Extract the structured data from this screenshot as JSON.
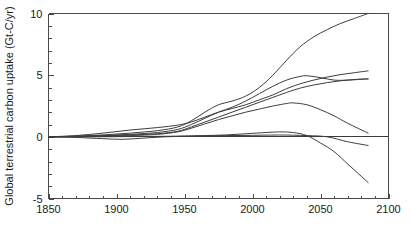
{
  "chart_data": {
    "type": "line",
    "title": "",
    "xlabel": "",
    "ylabel": "Global terrestrial carbon uptake (Gt-C/yr)",
    "xlim": [
      1850,
      2100
    ],
    "ylim": [
      -5,
      10
    ],
    "xticks": [
      1850,
      1900,
      1950,
      2000,
      2050,
      2100
    ],
    "xtick_labels": [
      "1850",
      "1900",
      "1950",
      "2000",
      "2050",
      "2100"
    ],
    "yticks": [
      -5,
      0,
      5,
      10
    ],
    "ytick_labels": [
      "-5",
      "0",
      "5",
      "10"
    ],
    "x_minor_tick_interval": 10,
    "y_minor_tick_interval": 1,
    "grid": false,
    "legend": null,
    "zero_reference_line": true,
    "series": [
      {
        "name": "curve-1-highest",
        "x": [
          1850,
          1870,
          1890,
          1910,
          1930,
          1945,
          1955,
          1965,
          1975,
          1985,
          1995,
          2005,
          2015,
          2025,
          2035,
          2045,
          2055,
          2065,
          2075,
          2085
        ],
        "values": [
          0.0,
          0.05,
          0.15,
          0.3,
          0.5,
          0.8,
          1.3,
          2.0,
          2.6,
          2.9,
          3.3,
          4.0,
          5.0,
          6.2,
          7.3,
          8.1,
          8.7,
          9.2,
          9.6,
          10.0
        ]
      },
      {
        "name": "curve-2-upper-rising",
        "x": [
          1850,
          1870,
          1890,
          1910,
          1930,
          1945,
          1955,
          1965,
          1975,
          1985,
          1995,
          2005,
          2015,
          2025,
          2035,
          2045,
          2055,
          2065,
          2075,
          2085
        ],
        "values": [
          0.0,
          0.1,
          0.3,
          0.55,
          0.75,
          0.95,
          1.2,
          1.6,
          2.0,
          2.3,
          2.6,
          3.0,
          3.4,
          3.9,
          4.3,
          4.6,
          4.85,
          5.05,
          5.2,
          5.35
        ]
      },
      {
        "name": "curve-3-plateau-near-5",
        "x": [
          1850,
          1870,
          1890,
          1910,
          1930,
          1945,
          1955,
          1965,
          1975,
          1985,
          1995,
          2005,
          2015,
          2025,
          2035,
          2040,
          2050,
          2060,
          2070,
          2085
        ],
        "values": [
          0.0,
          0.05,
          0.1,
          0.2,
          0.35,
          0.6,
          1.0,
          1.5,
          2.0,
          2.4,
          2.9,
          3.5,
          4.1,
          4.6,
          4.9,
          4.95,
          4.8,
          4.6,
          4.6,
          4.7
        ]
      },
      {
        "name": "curve-4-rising-to-4-6",
        "x": [
          1850,
          1870,
          1890,
          1910,
          1930,
          1945,
          1955,
          1965,
          1975,
          1985,
          1995,
          2005,
          2015,
          2025,
          2035,
          2045,
          2055,
          2065,
          2075,
          2085
        ],
        "values": [
          0.0,
          0.03,
          0.08,
          0.15,
          0.25,
          0.45,
          0.8,
          1.2,
          1.6,
          2.0,
          2.4,
          2.8,
          3.2,
          3.6,
          3.95,
          4.2,
          4.4,
          4.55,
          4.65,
          4.7
        ]
      },
      {
        "name": "curve-5-hump-declining",
        "x": [
          1850,
          1870,
          1890,
          1910,
          1930,
          1945,
          1955,
          1965,
          1975,
          1985,
          1995,
          2005,
          2015,
          2025,
          2030,
          2040,
          2050,
          2060,
          2070,
          2085
        ],
        "values": [
          0.0,
          0.02,
          0.05,
          0.1,
          0.2,
          0.4,
          0.7,
          1.05,
          1.4,
          1.7,
          2.0,
          2.25,
          2.5,
          2.7,
          2.75,
          2.6,
          2.2,
          1.7,
          1.1,
          0.3
        ]
      },
      {
        "name": "curve-6-flat-then-plunge",
        "x": [
          1850,
          1870,
          1890,
          1905,
          1920,
          1935,
          1950,
          1965,
          1980,
          1995,
          2010,
          2020,
          2030,
          2040,
          2050,
          2060,
          2070,
          2078,
          2085
        ],
        "values": [
          0.0,
          -0.05,
          -0.15,
          -0.2,
          -0.1,
          0.0,
          0.05,
          0.1,
          0.15,
          0.25,
          0.35,
          0.4,
          0.35,
          0.1,
          -0.5,
          -1.2,
          -2.2,
          -3.0,
          -3.7
        ]
      },
      {
        "name": "curve-7-low-flat-slight-negative",
        "x": [
          1850,
          1880,
          1910,
          1940,
          1960,
          1980,
          2000,
          2020,
          2040,
          2055,
          2070,
          2085
        ],
        "values": [
          0.0,
          0.0,
          0.02,
          0.05,
          0.08,
          0.1,
          0.12,
          0.15,
          0.1,
          0.0,
          -0.4,
          -0.7
        ]
      }
    ]
  }
}
